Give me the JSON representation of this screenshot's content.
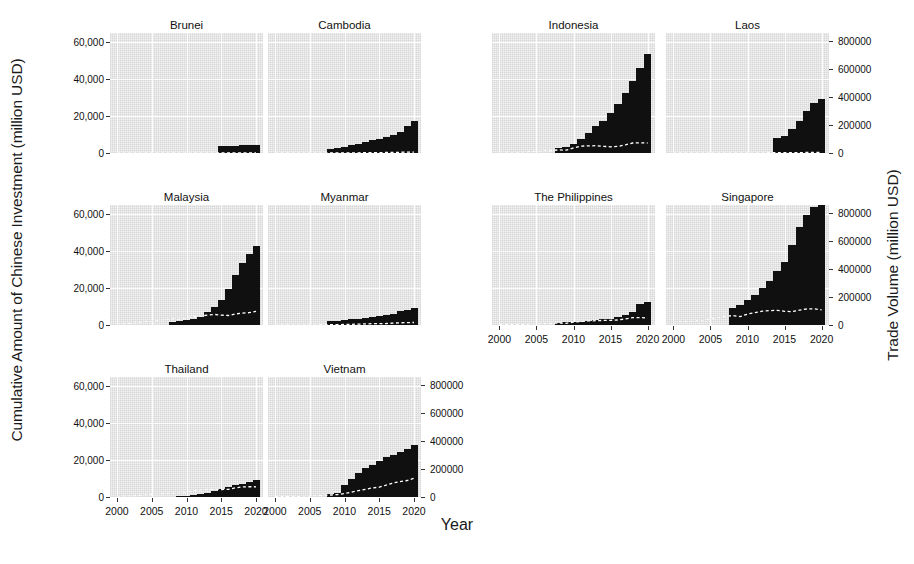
{
  "chart_data": {
    "type": "bar",
    "title": "",
    "xlabel": "Year",
    "ylabel": "Cumulative Amount of Chinese Investment (million USD)",
    "y2label": "Trade Volume (million USD)",
    "grid": true,
    "legend": "none",
    "x": [
      2000,
      2001,
      2002,
      2003,
      2004,
      2005,
      2006,
      2007,
      2008,
      2009,
      2010,
      2011,
      2012,
      2013,
      2014,
      2015,
      2016,
      2017,
      2018,
      2019,
      2020
    ],
    "xlim": [
      1999,
      2021
    ],
    "xticks": [
      2000,
      2005,
      2010,
      2015,
      2020
    ],
    "xtick_labels": [
      "2000",
      "2005",
      "2010",
      "2015",
      "2020"
    ],
    "ylim": [
      0,
      65000
    ],
    "yticks": [
      0,
      20000,
      40000,
      60000
    ],
    "ytick_labels": [
      "0",
      "20,000",
      "40,000",
      "60,000"
    ],
    "y2lim": [
      0,
      860000
    ],
    "y2ticks": [
      0,
      200000,
      400000,
      600000,
      800000
    ],
    "y2tick_labels": [
      "0",
      "200000",
      "400000",
      "600000",
      "800000"
    ],
    "bar_color": "#101010",
    "line_color": "#ffffff",
    "panel_color": "#f2f2f2",
    "facets": [
      {
        "name": "Brunei",
        "row": 0,
        "col": 0,
        "axis_side": "left",
        "bars": [
          0,
          0,
          0,
          0,
          0,
          0,
          0,
          0,
          0,
          0,
          0,
          0,
          0,
          0,
          0,
          3900,
          4000,
          4050,
          4100,
          4150,
          4200
        ],
        "line": [
          90,
          100,
          110,
          120,
          140,
          160,
          180,
          200,
          220,
          200,
          260,
          300,
          320,
          330,
          300,
          250,
          230,
          260,
          300,
          290,
          250
        ]
      },
      {
        "name": "Cambodia",
        "row": 0,
        "col": 1,
        "axis_side": "left",
        "bars": [
          0,
          0,
          0,
          0,
          0,
          0,
          0,
          0,
          2000,
          2600,
          3300,
          4100,
          5000,
          5900,
          6800,
          7700,
          8700,
          9800,
          11500,
          14500,
          17500
        ],
        "line": [
          180,
          200,
          230,
          280,
          350,
          430,
          530,
          660,
          800,
          740,
          1000,
          1300,
          1600,
          1900,
          2300,
          2800,
          3400,
          4100,
          5200,
          6200,
          6800
        ]
      },
      {
        "name": "Indonesia",
        "row": 0,
        "col": 2,
        "axis_side": "right",
        "bars": [
          0,
          0,
          0,
          0,
          0,
          0,
          0,
          0,
          2500,
          3400,
          5000,
          7500,
          11000,
          14500,
          17500,
          21500,
          26500,
          32500,
          39000,
          46000,
          53500
        ],
        "line": [
          7800,
          6900,
          6700,
          7300,
          9100,
          12300,
          14800,
          18200,
          22500,
          20000,
          36100,
          49200,
          51000,
          52400,
          48200,
          44500,
          47600,
          58800,
          72000,
          72800,
          71400
        ]
      },
      {
        "name": "Laos",
        "row": 0,
        "col": 3,
        "axis_side": "right",
        "bars": [
          0,
          0,
          0,
          0,
          0,
          0,
          0,
          0,
          0,
          0,
          0,
          0,
          0,
          0,
          8000,
          9000,
          13000,
          17500,
          22500,
          27000,
          29500
        ],
        "line": [
          40,
          50,
          60,
          80,
          130,
          180,
          250,
          350,
          420,
          430,
          1000,
          1300,
          1700,
          2100,
          2700,
          2800,
          2300,
          3000,
          3500,
          3800,
          3500
        ]
      },
      {
        "name": "Malaysia",
        "row": 1,
        "col": 0,
        "axis_side": "left",
        "bars": [
          0,
          0,
          0,
          0,
          0,
          0,
          0,
          0,
          1800,
          2200,
          2800,
          3500,
          4500,
          7000,
          9500,
          13500,
          19500,
          27000,
          33500,
          38500,
          43000
        ],
        "line": [
          8000,
          9100,
          12000,
          17000,
          24000,
          27000,
          33000,
          40000,
          45000,
          40000,
          53500,
          60000,
          64000,
          72000,
          76000,
          71000,
          68000,
          79000,
          85000,
          88000,
          98000
        ]
      },
      {
        "name": "Myanmar",
        "row": 1,
        "col": 1,
        "axis_side": "left",
        "bars": [
          0,
          0,
          0,
          0,
          0,
          0,
          0,
          0,
          2000,
          2300,
          2600,
          3000,
          3400,
          3800,
          4300,
          4800,
          5400,
          6000,
          7800,
          8400,
          9000
        ],
        "line": [
          560,
          630,
          700,
          800,
          940,
          1100,
          1400,
          1800,
          2100,
          1900,
          4400,
          5000,
          6200,
          7900,
          9500,
          9400,
          10800,
          13300,
          15600,
          17000,
          18000
        ]
      },
      {
        "name": "The Philippines",
        "row": 1,
        "col": 2,
        "axis_side": "right",
        "bars": [
          0,
          0,
          0,
          0,
          0,
          0,
          0,
          0,
          1200,
          1400,
          1600,
          1900,
          2200,
          2600,
          3000,
          3500,
          4400,
          5500,
          7000,
          11500,
          12500
        ],
        "line": [
          2200,
          2500,
          3100,
          4300,
          6000,
          8000,
          10000,
          12000,
          13500,
          12000,
          20000,
          25000,
          29500,
          30500,
          33000,
          34000,
          36000,
          44000,
          52000,
          53000,
          51000
        ]
      },
      {
        "name": "Singapore",
        "row": 1,
        "col": 3,
        "axis_side": "right",
        "bars": [
          0,
          0,
          0,
          0,
          0,
          0,
          0,
          0,
          9000,
          11000,
          13500,
          16500,
          20000,
          24000,
          29000,
          34000,
          43500,
          53000,
          59500,
          64000,
          66500
        ],
        "line": [
          22000,
          24000,
          26000,
          29000,
          35000,
          43000,
          52000,
          61000,
          68000,
          60000,
          78000,
          89000,
          99000,
          103000,
          105000,
          98000,
          95000,
          106000,
          115000,
          116000,
          109000
        ]
      },
      {
        "name": "Thailand",
        "row": 2,
        "col": 0,
        "axis_side": "left",
        "bars": [
          0,
          0,
          0,
          0,
          0,
          0,
          0,
          0,
          0,
          500,
          800,
          1200,
          1700,
          2400,
          3200,
          4200,
          5300,
          6300,
          7200,
          8200,
          9000
        ],
        "line": [
          6600,
          7400,
          8600,
          11000,
          14000,
          18000,
          22000,
          25000,
          28000,
          27000,
          38000,
          45000,
          50000,
          54000,
          56000,
          54000,
          55000,
          65000,
          72000,
          74000,
          73000
        ]
      },
      {
        "name": "Vietnam",
        "row": 2,
        "col": 1,
        "axis_side": "right",
        "bars": [
          0,
          0,
          0,
          0,
          0,
          0,
          0,
          0,
          1500,
          2200,
          6500,
          9500,
          13000,
          15500,
          17500,
          19500,
          21500,
          23000,
          24500,
          26000,
          28000
        ],
        "line": [
          2500,
          2800,
          3300,
          4200,
          5500,
          7000,
          9000,
          11000,
          14000,
          17000,
          25000,
          35000,
          45000,
          55000,
          65000,
          70000,
          85000,
          100000,
          110000,
          118000,
          135000
        ]
      }
    ]
  },
  "faint_caption": ""
}
